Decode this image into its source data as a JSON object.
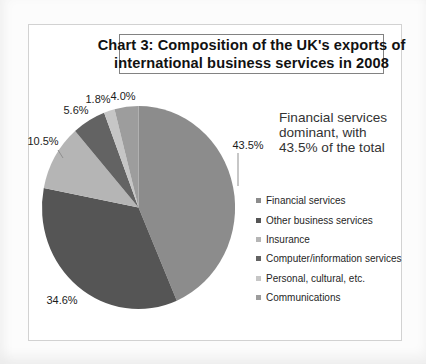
{
  "page": {
    "background": "#fcfcfc",
    "frame_border_color": "#d2d2d2"
  },
  "chart_data": {
    "type": "pie",
    "title": "Chart 3: Composition of the UK's exports of international business services in 2008",
    "title_lines": [
      "Chart 3: Composition of the UK's exports of",
      "international business services in 2008"
    ],
    "categories": [
      "Financial services",
      "Other business services",
      "Insurance",
      "Computer/information services",
      "Personal, cultural, etc.",
      "Communications"
    ],
    "values": [
      43.5,
      34.6,
      10.5,
      5.6,
      1.8,
      4.0
    ],
    "value_labels": [
      "43.5%",
      "34.6%",
      "10.5%",
      "5.6%",
      "1.8%",
      "4.0%"
    ],
    "colors": [
      "#8c8c8c",
      "#555555",
      "#b5b5b5",
      "#636363",
      "#c6c6c6",
      "#9d9d9d"
    ],
    "start_angle": "top-clockwise",
    "legend_position": "right",
    "grid": false,
    "annotation": "Financial services dominant, with 43.5% of the total",
    "annotation_lines": [
      "Financial services",
      "dominant, with",
      "43.5% of the total"
    ]
  }
}
